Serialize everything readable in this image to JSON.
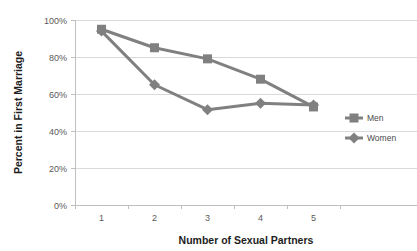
{
  "chart_data": {
    "type": "line",
    "title": "",
    "xlabel": "Number of Sexual Partners",
    "ylabel": "Percent in First Marriage",
    "categories": [
      "1",
      "2",
      "3",
      "4",
      "5"
    ],
    "x": [
      1,
      2,
      3,
      4,
      5
    ],
    "series": [
      {
        "name": "Men",
        "marker": "square",
        "color": "#808080",
        "values": [
          95,
          85,
          79,
          68,
          53
        ]
      },
      {
        "name": "Women",
        "marker": "diamond",
        "color": "#808080",
        "values": [
          94,
          65,
          51.5,
          55,
          54
        ]
      }
    ],
    "ylim": [
      0,
      100
    ],
    "yticks": [
      0,
      20,
      40,
      60,
      80,
      100
    ],
    "ytick_labels": [
      "0%",
      "20%",
      "40%",
      "60%",
      "80%",
      "100%"
    ],
    "grid": "horizontal",
    "legend_position": "right",
    "colors": {
      "series": "#808080",
      "gridline": "#d9d9d9",
      "axis": "#bfbfbf",
      "text": "#595959",
      "title_text": "#1d1d1d",
      "background": "#ffffff"
    }
  },
  "legend": {
    "items": [
      {
        "label": "Men"
      },
      {
        "label": "Women"
      }
    ]
  },
  "axes": {
    "y_title": "Percent in First Marriage",
    "x_title": "Number of Sexual Partners",
    "y_tick_labels": [
      "100%",
      "80%",
      "60%",
      "40%",
      "20%",
      "0%"
    ],
    "x_tick_labels": [
      "1",
      "2",
      "3",
      "4",
      "5"
    ]
  }
}
